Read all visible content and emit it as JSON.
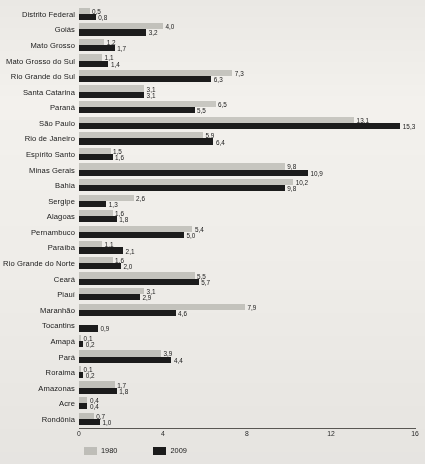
{
  "chart_data": {
    "type": "bar",
    "orientation": "horizontal",
    "title": "",
    "xlabel": "",
    "ylabel": "",
    "xlim": [
      0,
      16
    ],
    "xticks": [
      0,
      4,
      8,
      12,
      16
    ],
    "xtick_labels": [
      "0",
      "4",
      "8",
      "12",
      "16"
    ],
    "grid": false,
    "legend_position": "bottom-left",
    "categories": [
      "Distrito Federal",
      "Goiás",
      "Mato Grosso",
      "Mato Grosso do Sul",
      "Rio Grande do Sul",
      "Santa Catarina",
      "Paraná",
      "São Paulo",
      "Rio de Janeiro",
      "Espírito Santo",
      "Minas Gerais",
      "Bahia",
      "Sergipe",
      "Alagoas",
      "Pernambuco",
      "Paraíba",
      "Rio Grande do Norte",
      "Ceará",
      "Piauí",
      "Maranhão",
      "Tocantins",
      "Amapá",
      "Pará",
      "Roraima",
      "Amazonas",
      "Acre",
      "Rondônia"
    ],
    "series": [
      {
        "name": "1980",
        "color": "#c8c7c1",
        "values": [
          0.5,
          4.0,
          1.2,
          1.1,
          7.3,
          3.1,
          6.5,
          13.1,
          5.9,
          1.5,
          9.8,
          10.2,
          2.6,
          1.6,
          5.4,
          1.1,
          1.6,
          5.5,
          3.1,
          7.9,
          null,
          0.1,
          3.9,
          0.1,
          1.7,
          0.4,
          0.7
        ],
        "labels": [
          "0,5",
          "4,0",
          "1,2",
          "1,1",
          "7,3",
          "3,1",
          "6,5",
          "13,1",
          "5,9",
          "1,5",
          "9,8",
          "10,2",
          "2,6",
          "1,6",
          "5,4",
          "1,1",
          "1,6",
          "5,5",
          "3,1",
          "7,9",
          "",
          "0,1",
          "3,9",
          "0,1",
          "1,7",
          "0,4",
          "0,7"
        ]
      },
      {
        "name": "2009",
        "color": "#1c1c1c",
        "values": [
          0.8,
          3.2,
          1.7,
          1.4,
          6.3,
          3.1,
          5.5,
          15.3,
          6.4,
          1.6,
          10.9,
          9.8,
          1.3,
          1.8,
          5.0,
          2.1,
          2.0,
          5.7,
          2.9,
          4.6,
          0.9,
          0.2,
          4.4,
          0.2,
          1.8,
          0.4,
          1.0
        ],
        "labels": [
          "0,8",
          "3,2",
          "1,7",
          "1,4",
          "6,3",
          "3,1",
          "5,5",
          "15,3",
          "6,4",
          "1,6",
          "10,9",
          "9,8",
          "1,3",
          "1,8",
          "5,0",
          "2,1",
          "2,0",
          "5,7",
          "2,9",
          "4,6",
          "0,9",
          "0,2",
          "4,4",
          "0,2",
          "1,8",
          "0,4",
          "1,0"
        ]
      }
    ],
    "legend": [
      {
        "label": "1980",
        "color": "#c8c7c1"
      },
      {
        "label": "2009",
        "color": "#1c1c1c"
      }
    ]
  }
}
